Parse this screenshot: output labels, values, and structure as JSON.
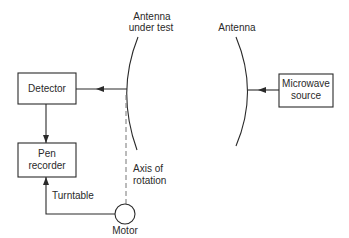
{
  "diagram": {
    "nodes": {
      "antenna_under_test": {
        "label_line1": "Antenna",
        "label_line2": "under test"
      },
      "antenna": {
        "label": "Antenna"
      },
      "detector": {
        "label": "Detector"
      },
      "microwave_source": {
        "label_line1": "Microwave",
        "label_line2": "source"
      },
      "pen_recorder": {
        "label_line1": "Pen",
        "label_line2": "recorder"
      },
      "motor": {
        "label": "Motor"
      }
    },
    "annotations": {
      "axis_line1": "Axis of",
      "axis_line2": "rotation",
      "turntable": "Turntable"
    },
    "edges": [
      {
        "from": "microwave_source",
        "to": "antenna",
        "style": "arrow"
      },
      {
        "from": "antenna_under_test",
        "to": "detector",
        "style": "arrow"
      },
      {
        "from": "detector",
        "to": "pen_recorder",
        "style": "arrow"
      },
      {
        "from": "motor",
        "to": "pen_recorder",
        "style": "arrow",
        "label": "Turntable"
      },
      {
        "from": "motor",
        "to": "antenna_under_test",
        "style": "dashed",
        "label": "Axis of rotation"
      }
    ],
    "colors": {
      "line": "#2a2a2a",
      "dashed": "#777777",
      "background": "#ffffff"
    }
  }
}
